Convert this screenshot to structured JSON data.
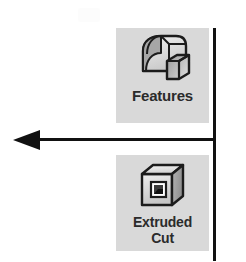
{
  "figure": {
    "name": "cad-toolbar-callout",
    "background_color": "#ffffff",
    "ink_color": "#111111"
  },
  "annotation": {
    "arrow": {
      "icon_name": "left-arrow",
      "direction": "left",
      "description": "Leader arrow pointing left from the vertical rule"
    },
    "divider": {
      "icon_name": "vertical-rule",
      "orientation": "vertical"
    }
  },
  "toolbar": {
    "background_color": "#d9d9d9",
    "buttons": [
      {
        "id": "features",
        "label": "Features",
        "label_line1": "Features",
        "label_line2": "",
        "icon_name": "features-solid-icon"
      },
      {
        "id": "extruded-cut",
        "label": "Extruded Cut",
        "label_line1": "Extruded",
        "label_line2": "Cut",
        "icon_name": "extruded-cut-icon"
      }
    ]
  }
}
